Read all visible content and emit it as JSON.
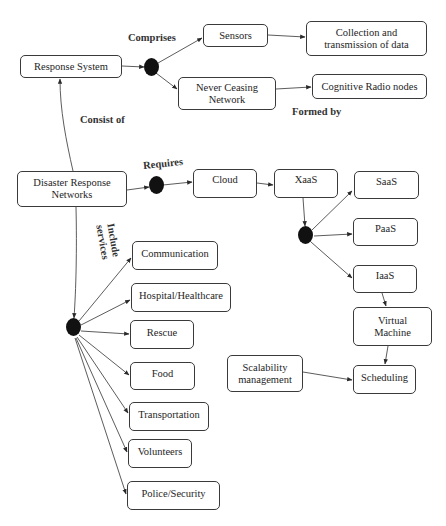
{
  "diagram": {
    "nodes": {
      "response_system": "Response System",
      "sensors": "Sensors",
      "never_ceasing_network_line1": "Never Ceasing",
      "never_ceasing_network_line2": "Network",
      "collection_line1": "Collection and",
      "collection_line2": "transmission of data",
      "cognitive_radio_nodes": "Cognitive Radio nodes",
      "disaster_line1": "Disaster Response",
      "disaster_line2": "Networks",
      "cloud": "Cloud",
      "xaas": "XaaS",
      "saas": "SaaS",
      "paas": "PaaS",
      "iaas": "IaaS",
      "virtual_machine_line1": "Virtual",
      "virtual_machine_line2": "Machine",
      "scheduling": "Scheduling",
      "scalability_line1": "Scalability",
      "scalability_line2": "management",
      "communication": "Communication",
      "hospital": "Hospital/Healthcare",
      "rescue": "Rescue",
      "food": "Food",
      "transportation": "Transportation",
      "volunteers": "Volunteers",
      "police": "Police/Security"
    },
    "edge_labels": {
      "comprises": "Comprises",
      "formed_by": "Formed by",
      "consist_of": "Consist of",
      "requires": "Requires",
      "include_line1": "Include",
      "include_line2": "services"
    },
    "colors": {
      "stroke": "#3a3a3a",
      "junction": "#111111",
      "background": "#ffffff"
    }
  }
}
